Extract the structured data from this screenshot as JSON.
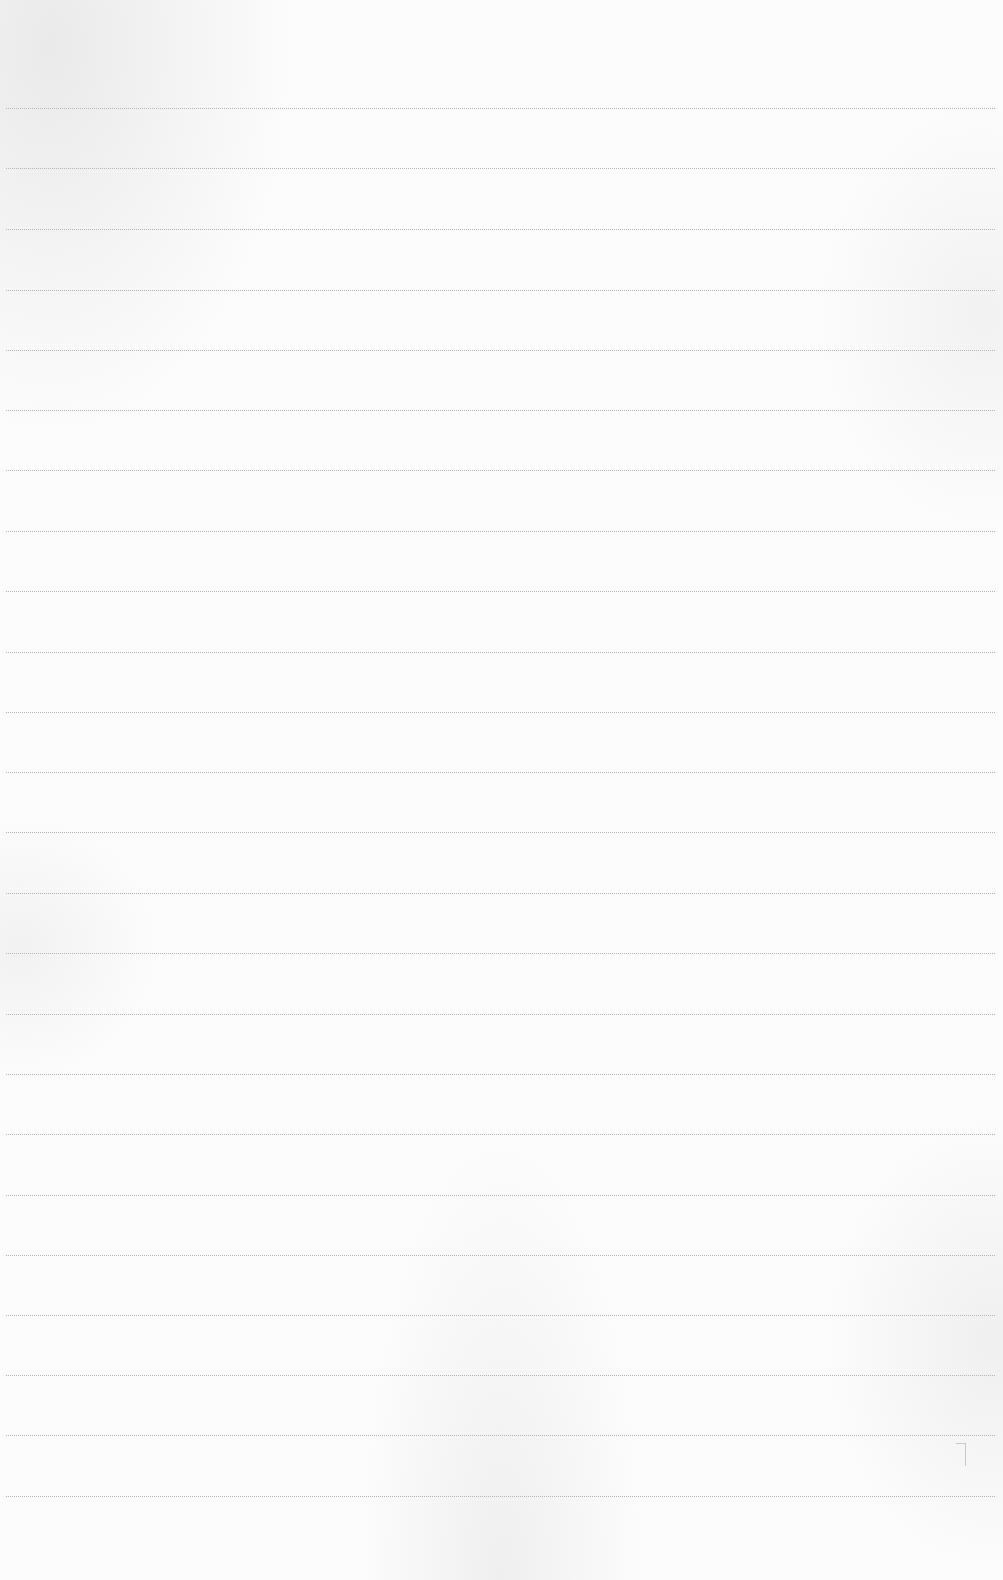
{
  "page": {
    "type": "lined-paper",
    "background_color": "#fcfcfc",
    "rule_color": "#b4b4b4",
    "rule_style": "dotted",
    "rule_count": 24,
    "rule_positions_y": [
      108,
      168,
      229,
      290,
      350,
      410,
      470,
      531,
      591,
      652,
      712,
      772,
      832,
      893,
      953,
      1014,
      1074,
      1134,
      1195,
      1255,
      1315,
      1375,
      1435,
      1496
    ],
    "text_content": ""
  }
}
